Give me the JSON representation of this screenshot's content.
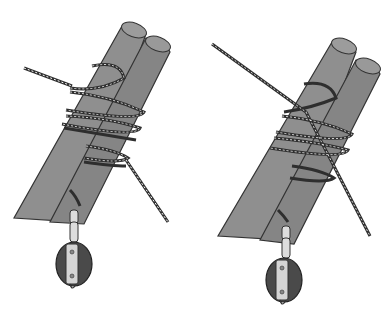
{
  "figure": {
    "background": "#ffffff",
    "panels": [
      {
        "id": "left",
        "subject": "two-poles-lashed-with-rope-and-pulley",
        "pole_color": "#8a8a8a",
        "pole_shadow": "#6e6e6e",
        "rope_color": "#3a3a3a",
        "pulley_color": "#4a4a4a",
        "hardware_color": "#d8d8d8"
      },
      {
        "id": "right",
        "subject": "two-poles-lashed-with-rope-and-pulley-variant",
        "pole_color": "#8a8a8a",
        "pole_shadow": "#6e6e6e",
        "rope_color": "#3a3a3a",
        "pulley_color": "#4a4a4a",
        "hardware_color": "#d8d8d8"
      }
    ]
  }
}
